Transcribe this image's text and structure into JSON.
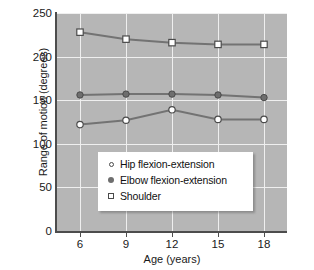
{
  "chart_data": {
    "type": "line",
    "title": "",
    "xlabel": "Age (years)",
    "ylabel": "Range of motion (degrees)",
    "categories": [
      "6",
      "9",
      "12",
      "15",
      "18"
    ],
    "x_values": [
      6,
      9,
      12,
      15,
      18
    ],
    "xlim": [
      4.5,
      19.5
    ],
    "ylim": [
      0,
      250
    ],
    "y_ticks": [
      0,
      50,
      100,
      150,
      200,
      250
    ],
    "x_ticks": [
      6,
      9,
      12,
      15,
      18
    ],
    "grid": true,
    "legend_position": "lower-center-left",
    "plot_background": "#b6b6b6",
    "gridline_color": "#efefef",
    "line_color": "#737373",
    "series": [
      {
        "name": "Hip flexion-extension",
        "marker": "open-circle",
        "values": [
          122,
          127,
          139,
          128,
          128
        ]
      },
      {
        "name": "Elbow flexion-extension",
        "marker": "filled-circle",
        "values": [
          156,
          157,
          157,
          156,
          153
        ]
      },
      {
        "name": "Shoulder",
        "marker": "open-square",
        "values": [
          228,
          220,
          216,
          214,
          214
        ]
      }
    ]
  },
  "axes": {
    "y_title": "Range of motion (degrees)",
    "x_title": "Age (years)",
    "y_tick_labels": [
      "250",
      "200",
      "150",
      "100",
      "50",
      "0"
    ],
    "x_tick_labels": [
      "6",
      "9",
      "12",
      "15",
      "18"
    ]
  },
  "legend": {
    "items": [
      {
        "label": "Hip flexion-extension",
        "marker": "open-circle-marker"
      },
      {
        "label": "Elbow flexion-extension",
        "marker": "filled-circle-marker"
      },
      {
        "label": "Shoulder",
        "marker": "open-square-marker"
      }
    ]
  }
}
